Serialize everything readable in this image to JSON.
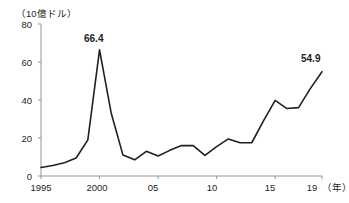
{
  "chart_data": {
    "type": "line",
    "title": "",
    "subtitle": "",
    "unit_label": "（10億ドル）",
    "xlabel": "（年）",
    "ylabel": "",
    "xlim": [
      1995,
      2019
    ],
    "ylim": [
      0,
      80
    ],
    "grid": false,
    "legend": "none",
    "y_ticks": [
      0,
      20,
      40,
      60,
      80
    ],
    "y_tick_labels": [
      "0",
      "20",
      "40",
      "60",
      "80"
    ],
    "x_ticks": [
      1995,
      2000,
      2005,
      2010,
      2015,
      2019
    ],
    "x_tick_labels": [
      "1995",
      "2000",
      "05",
      "10",
      "15",
      "19"
    ],
    "x": [
      1995,
      1996,
      1997,
      1998,
      1999,
      2000,
      2001,
      2002,
      2003,
      2004,
      2005,
      2006,
      2007,
      2008,
      2009,
      2010,
      2011,
      2012,
      2013,
      2014,
      2015,
      2016,
      2017,
      2018,
      2019
    ],
    "values": [
      4.5,
      5.5,
      7.0,
      9.5,
      19.0,
      66.4,
      33.0,
      11.0,
      8.5,
      13.0,
      10.5,
      13.5,
      16.0,
      16.0,
      10.8,
      15.5,
      19.5,
      17.5,
      17.5,
      29.0,
      39.8,
      35.5,
      36.0,
      46.0,
      54.9
    ],
    "annotations": [
      {
        "label": "66.4",
        "x": 2000,
        "y": 66.4
      },
      {
        "label": "54.9",
        "x": 2019,
        "y": 54.9
      }
    ],
    "line_color": "#231f20",
    "axis_color": "#939598"
  }
}
